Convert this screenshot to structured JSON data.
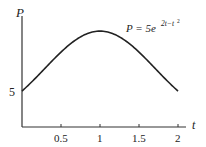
{
  "chart_data": {
    "type": "line",
    "title": "",
    "annotation": "P = 5e^{2t - t^2}",
    "xlabel": "t",
    "ylabel": "P",
    "x_ticks": [
      "0.5",
      "1",
      "1.5",
      "2"
    ],
    "y_ticks": [
      "5"
    ],
    "xlim": [
      0,
      2
    ],
    "ylim": [
      0,
      14
    ],
    "grid": false,
    "legend": "none",
    "series": [
      {
        "name": "P = 5e^(2t - t^2)",
        "x": [
          0,
          0.25,
          0.5,
          0.75,
          1,
          1.25,
          1.5,
          1.75,
          2
        ],
        "values": [
          5,
          7.77,
          10.59,
          12.74,
          13.59,
          12.74,
          10.59,
          7.77,
          5
        ]
      }
    ],
    "color": "#222222"
  },
  "labels": {
    "y_axis": "P",
    "x_axis": "t",
    "formula_lhs": "P = 5e",
    "formula_exp": "2t−t",
    "formula_sq": "2",
    "y5": "5",
    "x05": "0.5",
    "x1": "1",
    "x15": "1.5",
    "x2": "2"
  }
}
